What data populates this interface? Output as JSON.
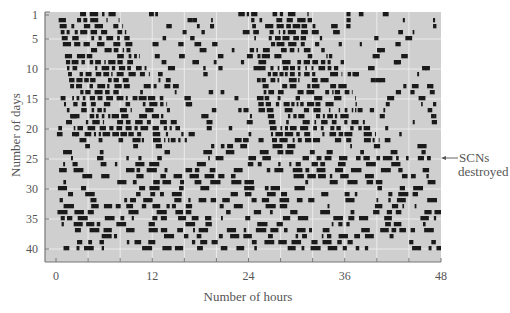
{
  "chart_data": {
    "type": "heatmap",
    "title": "",
    "subtype": "double-plotted actogram",
    "xlabel": "Number of hours",
    "ylabel": "Number of days",
    "x_ticks": [
      0,
      12,
      24,
      36,
      48
    ],
    "y_ticks": [
      1,
      5,
      10,
      15,
      20,
      25,
      30,
      35,
      40
    ],
    "xlim": [
      0,
      48
    ],
    "ylim": [
      1,
      40
    ],
    "grid": {
      "vertical_every_hours": 4,
      "horizontal_every_days": 5
    },
    "annotation": {
      "text_line1": "SCNs",
      "text_line2": "destroyed",
      "day": 23,
      "arrow": "pointing left to day 23"
    },
    "phases": [
      {
        "days": [
          1,
          22
        ],
        "description": "Intact SCN: consolidated free-running activity band drifting later each day (onset ~hour 1 on day 1 to ~hour 4 by day 22, offset ~hour 8 to ~hour 16), double-plotted at +24 h"
      },
      {
        "days": [
          23,
          40
        ],
        "description": "After SCN lesion: activity bouts scattered arrhythmically across all 48 hours"
      }
    ],
    "colors": {
      "background": "#cfcfcf",
      "bar": "#1a1a1a",
      "grid": "#f2f2f2",
      "axis": "#777777"
    }
  },
  "axes": {
    "x_label": "Number of hours",
    "y_label": "Number of days",
    "x_tick_labels": [
      "0",
      "12",
      "24",
      "36",
      "48"
    ],
    "y_tick_labels": [
      "1",
      "5",
      "10",
      "15",
      "20",
      "25",
      "30",
      "35",
      "40"
    ]
  },
  "annotation": {
    "line1": "SCNs",
    "line2": "destroyed"
  }
}
